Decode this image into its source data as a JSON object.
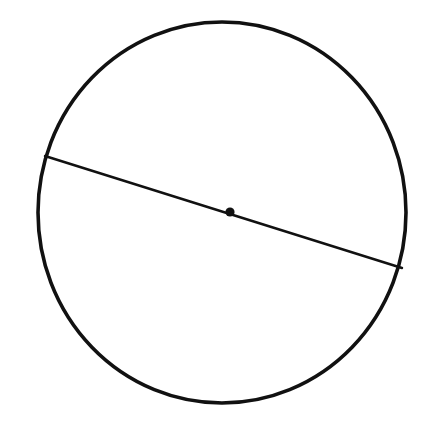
{
  "figure": {
    "background_color": "#ffffff",
    "width": 430,
    "height": 424,
    "stroke_color": "#111111",
    "fill_color": "none"
  },
  "chart_data": {
    "type": "scatter",
    "xlabel": "",
    "ylabel": "",
    "xlim": [
      0,
      430
    ],
    "ylim": [
      0,
      424
    ],
    "grid": false,
    "legend": "none",
    "shapes": [
      {
        "name": "circle-outline",
        "kind": "ellipse",
        "cx": 222,
        "cy": 212.5,
        "rx": 184,
        "ry": 190.5,
        "stroke": "#111111",
        "stroke_width": 3.6,
        "fill": "none"
      },
      {
        "name": "diameter-line",
        "kind": "line",
        "x1": 45,
        "y1": 156,
        "x2": 402,
        "y2": 268,
        "stroke": "#111111",
        "stroke_width": 2.4
      },
      {
        "name": "center-point",
        "kind": "dot",
        "cx": 230,
        "cy": 212,
        "r": 4.6,
        "fill": "#111111"
      }
    ],
    "annotations": []
  }
}
